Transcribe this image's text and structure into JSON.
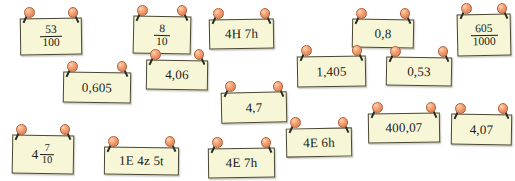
{
  "board": {
    "title": "Pinned number cards board",
    "background_color": "#ffffff",
    "card_color": "#f7f7d8",
    "card_border_color": "#4a4636",
    "pin_head_color": "#f2a074",
    "pin_needle_color": "#2b2b22",
    "pin_icon_name": "pushpin-icon",
    "card_count": 15
  },
  "cards": [
    {
      "id": "card-53-100",
      "kind": "fraction",
      "numerator": "53",
      "denominator": "100",
      "text": "53/100",
      "x": 20,
      "y": 18,
      "w": 62,
      "h": 37,
      "rot": -0.8
    },
    {
      "id": "card-8-10",
      "kind": "fraction",
      "numerator": "8",
      "denominator": "10",
      "text": "8/10",
      "x": 133,
      "y": 16,
      "w": 58,
      "h": 38,
      "rot": 1.2
    },
    {
      "id": "card-4H-7h",
      "kind": "text",
      "text": "4H 7h",
      "x": 209,
      "y": 19,
      "w": 65,
      "h": 30,
      "rot": -1.0
    },
    {
      "id": "card-0-8",
      "kind": "text",
      "text": "0,8",
      "x": 352,
      "y": 19,
      "w": 62,
      "h": 29,
      "rot": 1.0
    },
    {
      "id": "card-605-1000",
      "kind": "fraction",
      "numerator": "605",
      "denominator": "1000",
      "text": "605/1000",
      "x": 457,
      "y": 14,
      "w": 54,
      "h": 42,
      "rot": -1.2
    },
    {
      "id": "card-4-06",
      "kind": "text",
      "text": "4,06",
      "x": 146,
      "y": 60,
      "w": 62,
      "h": 30,
      "rot": 0.8
    },
    {
      "id": "card-1-405",
      "kind": "text",
      "text": "1,405",
      "x": 297,
      "y": 56,
      "w": 69,
      "h": 31,
      "rot": -1.0
    },
    {
      "id": "card-0-53",
      "kind": "text",
      "text": "0,53",
      "x": 386,
      "y": 57,
      "w": 66,
      "h": 29,
      "rot": 1.0
    },
    {
      "id": "card-0-605",
      "kind": "text",
      "text": "0,605",
      "x": 63,
      "y": 72,
      "w": 68,
      "h": 31,
      "rot": 0.9
    },
    {
      "id": "card-4-7",
      "kind": "text",
      "text": "4,7",
      "x": 221,
      "y": 92,
      "w": 66,
      "h": 31,
      "rot": -1.2
    },
    {
      "id": "card-400-07",
      "kind": "text",
      "text": "400,07",
      "x": 368,
      "y": 113,
      "w": 72,
      "h": 30,
      "rot": -0.9
    },
    {
      "id": "card-4-07",
      "kind": "text",
      "text": "4,07",
      "x": 451,
      "y": 114,
      "w": 61,
      "h": 31,
      "rot": 0.9
    },
    {
      "id": "card-4E-6h",
      "kind": "text",
      "text": "4E 6h",
      "x": 286,
      "y": 128,
      "w": 66,
      "h": 29,
      "rot": -1.1
    },
    {
      "id": "card-4-7-10",
      "kind": "mixed",
      "whole": "4",
      "numerator": "7",
      "denominator": "10",
      "text": "4 7/10",
      "x": 12,
      "y": 135,
      "w": 62,
      "h": 39,
      "rot": 0.9
    },
    {
      "id": "card-1E-4z-5t",
      "kind": "text",
      "text": "1E 4z 5t",
      "x": 104,
      "y": 147,
      "w": 75,
      "h": 28,
      "rot": 0.6
    },
    {
      "id": "card-4E-7h",
      "kind": "text",
      "text": "4E 7h",
      "x": 208,
      "y": 148,
      "w": 67,
      "h": 30,
      "rot": -0.7
    }
  ]
}
